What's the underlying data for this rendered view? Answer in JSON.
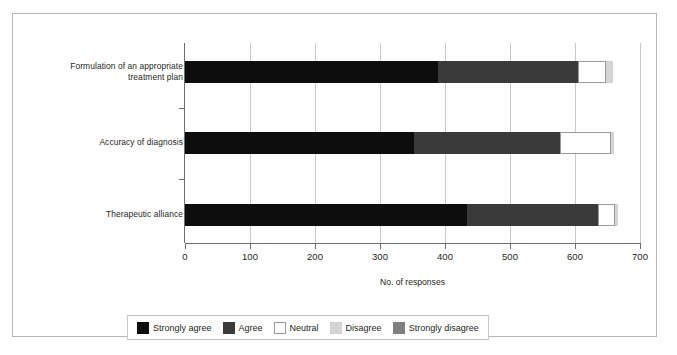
{
  "chart_data": {
    "type": "bar",
    "orientation": "horizontal",
    "stacked": true,
    "title": "",
    "xlabel": "No. of responses",
    "ylabel": "",
    "xlim": [
      0,
      700
    ],
    "xticks": [
      0,
      100,
      200,
      300,
      400,
      500,
      600,
      700
    ],
    "xtick_labels": [
      "0",
      "100",
      "200",
      "300",
      "400",
      "500",
      "600",
      "700"
    ],
    "grid": "vertical",
    "legend_position": "bottom",
    "categories": [
      "Formulation of an appropriate treatment plan",
      "Accuracy of diagnosis",
      "Therapeutic alliance"
    ],
    "category_label_lines": [
      [
        "Formulation of an appropriate",
        "treatment plan"
      ],
      [
        "Accuracy of diagnosis"
      ],
      [
        "Therapeutic alliance"
      ]
    ],
    "series": [
      {
        "name": "Strongly agree",
        "color": "#0d0d0d",
        "values": [
          389,
          353,
          434
        ]
      },
      {
        "name": "Agree",
        "color": "#3a3a3a",
        "values": [
          215,
          224,
          201
        ]
      },
      {
        "name": "Neutral",
        "color": "#ffffff",
        "values": [
          44,
          78,
          26
        ]
      },
      {
        "name": "Disagree",
        "color": "#d4d4d4",
        "values": [
          10,
          5,
          5
        ]
      },
      {
        "name": "Strongly disagree",
        "color": "#808080",
        "values": [
          0,
          0,
          0
        ]
      }
    ],
    "totals": [
      658,
      660,
      666
    ]
  },
  "legend": {
    "items": [
      {
        "label": "Strongly agree",
        "color": "#0d0d0d"
      },
      {
        "label": "Agree",
        "color": "#3a3a3a"
      },
      {
        "label": "Neutral",
        "color": "#ffffff"
      },
      {
        "label": "Disagree",
        "color": "#d4d4d4"
      },
      {
        "label": "Strongly disagree",
        "color": "#808080"
      }
    ]
  },
  "colors": {
    "frame": "#b5b5b5",
    "axis": "#6d6e71",
    "grid": "#c9c9c9",
    "text": "#231f20",
    "background": "#ffffff"
  }
}
